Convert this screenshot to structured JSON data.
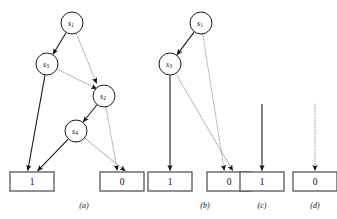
{
  "figure": {
    "background_color": "#ffffff",
    "solid_edge_color": "#111111",
    "dotted_edge_color": "#9a9a9a",
    "node_stroke_color": "#1a1a1a",
    "box_stroke_color": "#565656"
  },
  "panels": [
    {
      "caption": "(a)",
      "caption_x": 84,
      "caption_y": 205,
      "nodes": [
        {
          "id": "a-s1",
          "label": "s",
          "sub": "1",
          "cx": 72,
          "cy": 23,
          "r": 11
        },
        {
          "id": "a-s3",
          "label": "s",
          "sub": "3",
          "cx": 47,
          "cy": 64,
          "r": 11
        },
        {
          "id": "a-s2",
          "label": "s",
          "sub": "2",
          "cx": 104,
          "cy": 96,
          "r": 11
        },
        {
          "id": "a-s4",
          "label": "s",
          "sub": "4",
          "cx": 76,
          "cy": 131,
          "r": 11
        }
      ],
      "terminals": [
        {
          "id": "a-t1",
          "label": "1",
          "x": 10,
          "y": 172,
          "w": 44,
          "h": 19
        },
        {
          "id": "a-t0",
          "label": "0",
          "x": 100,
          "y": 172,
          "w": 44,
          "h": 19
        }
      ],
      "edges": [
        {
          "from": "a-s1",
          "to": "a-s3",
          "style": "solid"
        },
        {
          "from": "a-s1",
          "to": "a-s2",
          "style": "dotted"
        },
        {
          "from": "a-s3",
          "to": "a-s2",
          "style": "dotted"
        },
        {
          "from": "a-s3",
          "to": "a-t1",
          "style": "solid"
        },
        {
          "from": "a-s2",
          "to": "a-s4",
          "style": "solid"
        },
        {
          "from": "a-s2",
          "to": "a-t0",
          "style": "dotted"
        },
        {
          "from": "a-s4",
          "to": "a-t1",
          "style": "solid"
        },
        {
          "from": "a-s4",
          "to": "a-t0",
          "style": "dotted"
        }
      ]
    },
    {
      "caption": "(b)",
      "caption_x": 205,
      "caption_y": 205,
      "nodes": [
        {
          "id": "b-s1",
          "label": "s",
          "sub": "1",
          "cx": 201,
          "cy": 23,
          "r": 11
        },
        {
          "id": "b-s3",
          "label": "s",
          "sub": "3",
          "cx": 170,
          "cy": 64,
          "r": 11
        }
      ],
      "terminals": [
        {
          "id": "b-t1",
          "label": "1",
          "x": 148,
          "y": 172,
          "w": 44,
          "h": 19
        },
        {
          "id": "b-t0",
          "label": "0",
          "x": 207,
          "y": 172,
          "w": 44,
          "h": 19
        }
      ],
      "edges": [
        {
          "from": "b-s1",
          "to": "b-s3",
          "style": "solid"
        },
        {
          "from": "b-s1",
          "to": "b-t0",
          "style": "dotted"
        },
        {
          "from": "b-s3",
          "to": "b-t1",
          "style": "solid"
        },
        {
          "from": "b-s3",
          "to": "b-t0",
          "style": "dotted"
        }
      ]
    },
    {
      "caption": "(c)",
      "caption_x": 262,
      "caption_y": 205,
      "nodes": [],
      "terminals": [
        {
          "id": "c-t1",
          "label": "1",
          "x": 240,
          "y": 172,
          "w": 44,
          "h": 19
        }
      ],
      "edges": [
        {
          "from": "stub",
          "to": "c-t1",
          "style": "solid",
          "stub_x": 262,
          "stub_y": 104
        }
      ]
    },
    {
      "caption": "(d)",
      "caption_x": 315,
      "caption_y": 205,
      "nodes": [],
      "terminals": [
        {
          "id": "d-t0",
          "label": "0",
          "x": 293,
          "y": 172,
          "w": 44,
          "h": 19
        }
      ],
      "edges": [
        {
          "from": "stub",
          "to": "d-t0",
          "style": "dotted",
          "stub_x": 315,
          "stub_y": 104
        }
      ]
    }
  ]
}
